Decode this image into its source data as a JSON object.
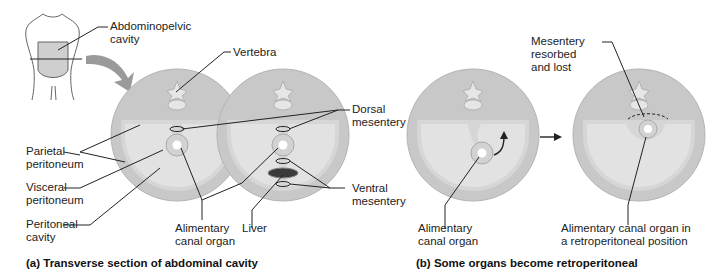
{
  "figure": {
    "panel_a": {
      "caption": "(a)  Transverse section of abdominal cavity",
      "labels": {
        "abdominopelvic_cavity": "Abdominopelvic\ncavity",
        "vertebra": "Vertebra",
        "dorsal_mesentery": "Dorsal\nmesentery",
        "parietal_peritoneum": "Parietal\nperitoneum",
        "visceral_peritoneum": "Visceral\nperitoneum",
        "peritoneal_cavity": "Peritoneal\ncavity",
        "alimentary_canal_organ": "Alimentary\ncanal organ",
        "liver": "Liver",
        "ventral_mesentery": "Ventral\nmesentery"
      }
    },
    "panel_b": {
      "caption": "(b)  Some organs become retroperitoneal",
      "labels": {
        "mesentery_resorbed": "Mesentery\nresorbed\nand lost",
        "alimentary_canal_organ": "Alimentary\ncanal organ",
        "retroperitoneal_organ": "Alimentary canal organ in\na retroperitoneal position"
      }
    },
    "colors": {
      "body_wall": "#c8c8c8",
      "body_wall_edge": "#b4b4b4",
      "cavity": "#e2e2e2",
      "rim": "#d6d6d6",
      "liver": "#3a3a3a",
      "leader": "#222222",
      "arrow_fill": "#9a9a9a"
    }
  }
}
